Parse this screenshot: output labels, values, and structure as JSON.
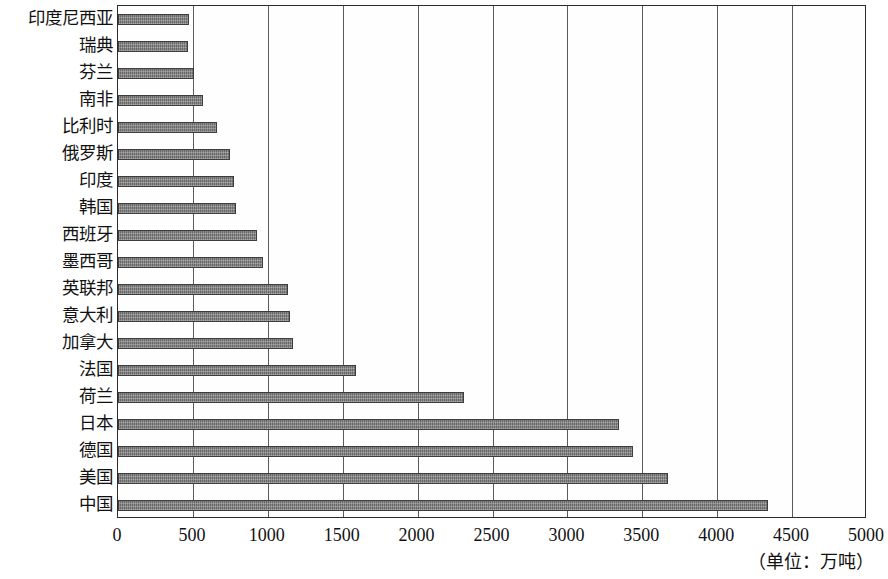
{
  "chart_data": {
    "type": "bar",
    "orientation": "horizontal",
    "title": "",
    "xlabel": "",
    "ylabel": "",
    "unit_caption": "（单位：万吨）",
    "xlim": [
      0,
      5000
    ],
    "xticks": [
      "0",
      "500",
      "1000",
      "1500",
      "2000",
      "2500",
      "3000",
      "3500",
      "4000",
      "4500",
      "5000"
    ],
    "xtick_values": [
      0,
      500,
      1000,
      1500,
      2000,
      2500,
      3000,
      3500,
      4000,
      4500,
      5000
    ],
    "grid": "vertical",
    "legend": "none",
    "bar_color": "#7b7b7b",
    "bar_edge_color": "#3d3d3d",
    "axis_color": "#2b2b2b",
    "categories": [
      "印度尼西亚",
      "瑞典",
      "芬兰",
      "南非",
      "比利时",
      "俄罗斯",
      "印度",
      "韩国",
      "西班牙",
      "墨西哥",
      "英联邦",
      "意大利",
      "加拿大",
      "法国",
      "荷兰",
      "日本",
      "德国",
      "美国",
      "中国"
    ],
    "values": [
      475,
      470,
      505,
      565,
      660,
      750,
      775,
      790,
      930,
      970,
      1135,
      1145,
      1170,
      1590,
      2310,
      3345,
      3435,
      3670,
      4340
    ]
  }
}
